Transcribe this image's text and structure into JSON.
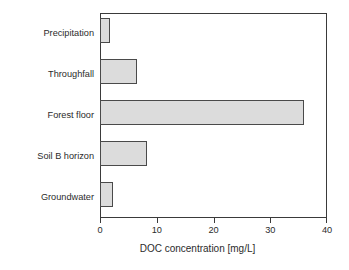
{
  "chart_data": {
    "type": "bar",
    "orientation": "horizontal",
    "title": "",
    "xlabel": "DOC concentration [mg/L]",
    "ylabel": "",
    "categories": [
      "Precipitation",
      "Throughfall",
      "Forest floor",
      "Soil B horizon",
      "Groundwater"
    ],
    "values": [
      1.8,
      6.5,
      36.0,
      8.3,
      2.3
    ],
    "xlim": [
      0,
      40
    ],
    "xticks": [
      0,
      10,
      20,
      30,
      40
    ],
    "xtick_labels": [
      "0",
      "10",
      "20",
      "30",
      "40"
    ],
    "grid": false,
    "legend": null,
    "bar_fill_color": "#dcdcdc",
    "bar_border_color": "#4a4a4a",
    "axis_color": "#3a3a3a"
  }
}
